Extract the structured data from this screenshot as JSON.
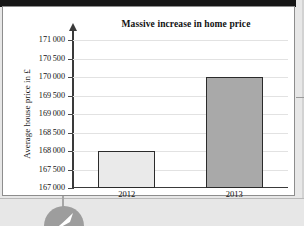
{
  "chart_data": {
    "type": "bar",
    "title": "Massive increase in home price",
    "xlabel": "",
    "ylabel": "Average house price in £",
    "categories": [
      "2012",
      "2013"
    ],
    "values": [
      168000,
      170000
    ],
    "ylim": [
      167000,
      171000
    ],
    "ytick_step": 500,
    "ytick_labels": [
      "171 000",
      "170 500",
      "170 000",
      "169 500",
      "169 000",
      "168 500",
      "168 000",
      "167 500",
      "167 000"
    ],
    "ytick_values": [
      171000,
      170500,
      170000,
      169500,
      169000,
      168500,
      168000,
      167500,
      167000
    ],
    "grid": true,
    "legend": "none",
    "series": [
      {
        "name": "Average house price",
        "values": [
          168000,
          170000
        ],
        "bar_colors": [
          "#eaeaea",
          "#a9a9a9"
        ],
        "bar_border_color": "#2b2b2b"
      }
    ],
    "colors": {
      "bar_2012_fill": "#eaeaea",
      "bar_2013_fill": "#a9a9a9",
      "bar_border": "#2b2b2b",
      "axis": "#3a3a3a",
      "gridline": "#e2e2e2",
      "text": "#111111",
      "paper": "#ffffff",
      "scan_background": "#e7e7e7",
      "top_band": "#161616",
      "logo": "#9d9d9d"
    }
  },
  "page": {
    "logo_icon": "circle-swoosh-logo"
  }
}
